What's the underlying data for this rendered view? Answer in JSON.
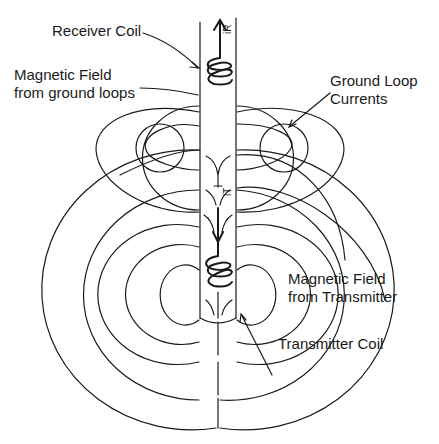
{
  "diagram": {
    "labels": {
      "receiver_coil": "Receiver Coil",
      "field_ground_loops_1": "Magnetic Field",
      "field_ground_loops_2": "from ground loops",
      "ground_loop_currents_1": "Ground Loop",
      "ground_loop_currents_2": "Currents",
      "field_transmitter_1": "Magnetic Field",
      "field_transmitter_2": "from Transmitter",
      "transmitter_coil": "Transmitter Coil"
    },
    "symbols": {
      "receiver_current": "iR",
      "transmitter_current": "iT"
    },
    "colors": {
      "line": "#1a1a1a",
      "background": "#ffffff"
    }
  }
}
